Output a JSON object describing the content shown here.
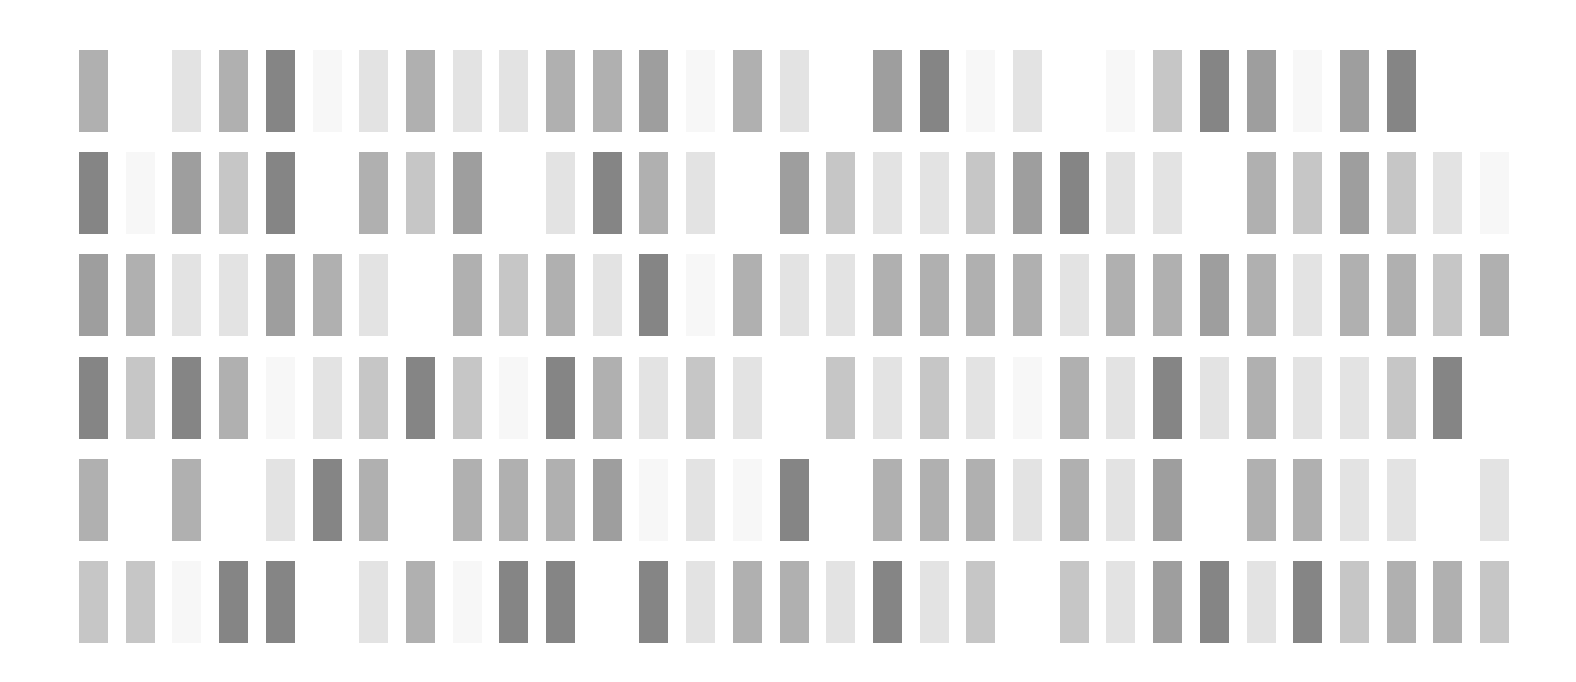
{
  "grid": {
    "columns": 31,
    "rows": 6,
    "origin_x": 79,
    "origin_y": 50,
    "col_pitch": 46.7,
    "row_pitch": 102.2,
    "tile_width": 29,
    "tile_height": 82,
    "background": "#ffffff",
    "shade_palette": {
      "0": null,
      "1": "#f7f7f7",
      "2": "#e3e3e3",
      "3": "#c6c6c6",
      "4": "#b0b0b0",
      "5": "#9e9e9e",
      "6": "#858585"
    },
    "levels": [
      [
        4,
        0,
        2,
        4,
        6,
        1,
        2,
        4,
        2,
        2,
        4,
        4,
        5,
        1,
        4,
        2,
        0,
        5,
        6,
        1,
        2,
        0,
        1,
        3,
        6,
        5,
        1,
        5,
        6,
        0,
        0
      ],
      [
        6,
        1,
        5,
        3,
        6,
        0,
        4,
        3,
        5,
        0,
        2,
        6,
        4,
        2,
        0,
        5,
        3,
        2,
        2,
        3,
        5,
        6,
        2,
        2,
        0,
        4,
        3,
        5,
        3,
        2,
        1
      ],
      [
        5,
        4,
        2,
        2,
        5,
        4,
        2,
        0,
        4,
        3,
        4,
        2,
        6,
        1,
        4,
        2,
        2,
        4,
        4,
        4,
        4,
        2,
        4,
        4,
        5,
        4,
        2,
        4,
        4,
        3,
        4
      ],
      [
        6,
        3,
        6,
        4,
        1,
        2,
        3,
        6,
        3,
        1,
        6,
        4,
        2,
        3,
        2,
        0,
        3,
        2,
        3,
        2,
        1,
        4,
        2,
        6,
        2,
        4,
        2,
        2,
        3,
        6,
        0
      ],
      [
        4,
        0,
        4,
        0,
        2,
        6,
        4,
        0,
        4,
        4,
        4,
        5,
        1,
        2,
        1,
        6,
        0,
        4,
        4,
        4,
        2,
        4,
        2,
        5,
        0,
        4,
        4,
        2,
        2,
        0,
        2
      ],
      [
        3,
        3,
        1,
        6,
        6,
        0,
        2,
        4,
        1,
        6,
        6,
        0,
        6,
        2,
        4,
        4,
        2,
        6,
        2,
        3,
        0,
        3,
        2,
        5,
        6,
        2,
        6,
        3,
        4,
        4,
        3
      ]
    ]
  }
}
